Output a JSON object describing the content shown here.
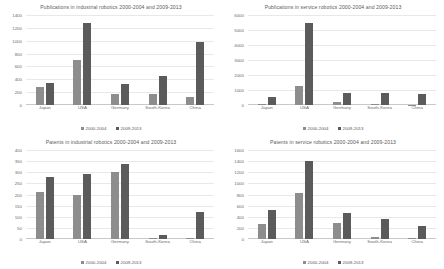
{
  "charts": [
    {
      "id": "publications-industrial",
      "title": "Publications in industrial robotics 2000-2004 and 2009-2013",
      "chart_data": {
        "type": "bar",
        "title": "Publications in industrial robotics 2000-2004 and 2009-2013",
        "xlabel": "",
        "ylabel": "",
        "ylim": [
          0,
          1400
        ],
        "yticks": [
          0,
          200,
          400,
          600,
          800,
          1000,
          1200,
          1400
        ],
        "grid": true,
        "legend_position": "bottom",
        "categories": [
          "Japan",
          "USA",
          "Germany",
          "South-Korea",
          "China"
        ],
        "series": [
          {
            "name": "2000-2004",
            "values": [
              275,
              700,
              175,
              175,
              130
            ],
            "color": "#8d8d8d"
          },
          {
            "name": "2009-2013",
            "values": [
              350,
              1280,
              320,
              455,
              985
            ],
            "color": "#5b5b5b"
          }
        ]
      }
    },
    {
      "id": "publications-service",
      "title": "Publications in service robotics 2000-2004 and 2009-2013",
      "chart_data": {
        "type": "bar",
        "title": "Publications in service robotics 2000-2004 and 2009-2013",
        "xlabel": "",
        "ylabel": "",
        "ylim": [
          0,
          6000
        ],
        "yticks": [
          0,
          1000,
          2000,
          3000,
          4000,
          5000,
          6000
        ],
        "grid": true,
        "legend_position": "bottom",
        "categories": [
          "Japan",
          "USA",
          "Germany",
          "South-Korea",
          "China"
        ],
        "series": [
          {
            "name": "2000-2004",
            "values": [
              90,
              1300,
              190,
              40,
              30
            ],
            "color": "#8d8d8d"
          },
          {
            "name": "2009-2013",
            "values": [
              560,
              5500,
              790,
              800,
              760
            ],
            "color": "#5b5b5b"
          }
        ]
      }
    },
    {
      "id": "patents-industrial",
      "title": "Patents in industrial robotics 2000-2004 and 2009-2013",
      "chart_data": {
        "type": "bar",
        "title": "Patents in industrial robotics 2000-2004 and 2009-2013",
        "xlabel": "",
        "ylabel": "",
        "ylim": [
          0,
          400
        ],
        "yticks": [
          0,
          50,
          100,
          150,
          200,
          250,
          300,
          350,
          400
        ],
        "grid": true,
        "legend_position": "bottom",
        "categories": [
          "Japan",
          "USA",
          "Germany",
          "South-Korea",
          "China"
        ],
        "series": [
          {
            "name": "2000-2004",
            "values": [
              212,
              200,
              300,
              5,
              3
            ],
            "color": "#8d8d8d"
          },
          {
            "name": "2009-2013",
            "values": [
              277,
              293,
              337,
              20,
              120
            ],
            "color": "#5b5b5b"
          }
        ]
      }
    },
    {
      "id": "patents-service",
      "title": "Patents in service robotics 2000-2004 and 2009-2013",
      "chart_data": {
        "type": "bar",
        "title": "Patents in service robotics 2000-2004 and 2009-2013",
        "xlabel": "",
        "ylabel": "",
        "ylim": [
          0,
          1600
        ],
        "yticks": [
          0,
          200,
          400,
          600,
          800,
          1000,
          1200,
          1400,
          1600
        ],
        "grid": true,
        "legend_position": "bottom",
        "categories": [
          "Japan",
          "USA",
          "Germany",
          "South-Korea",
          "China"
        ],
        "series": [
          {
            "name": "2000-2004",
            "values": [
              275,
              820,
              290,
              35,
              20
            ],
            "color": "#8d8d8d"
          },
          {
            "name": "2009-2013",
            "values": [
              530,
              1400,
              465,
              365,
              240
            ],
            "color": "#5b5b5b"
          }
        ]
      }
    }
  ],
  "legend": {
    "series0_label": "2000-2004",
    "series1_label": "2009-2013"
  },
  "colors": {
    "series0": "#8d8d8d",
    "series1": "#5b5b5b",
    "gridline": "#e8e8e8",
    "text": "#6b6b6b",
    "background": "#ffffff"
  }
}
